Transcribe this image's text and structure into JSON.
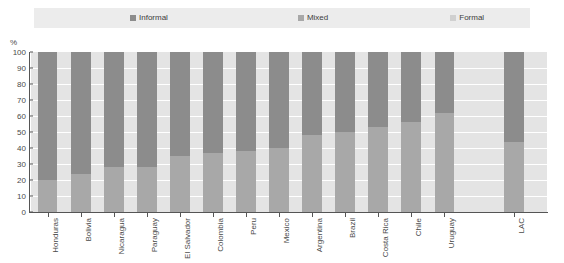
{
  "legend": {
    "items": [
      {
        "label": "Informal",
        "color": "#8c8c8c"
      },
      {
        "label": "Mixed",
        "color": "#a8a8a8"
      },
      {
        "label": "Formal",
        "color": "#d0d0d0"
      }
    ]
  },
  "axes": {
    "y_unit_label": "%",
    "y_ticks": [
      "0",
      "10",
      "20",
      "30",
      "40",
      "50",
      "60",
      "70",
      "80",
      "90",
      "100"
    ]
  },
  "chart_data": {
    "type": "bar",
    "title": "",
    "subtitle": "",
    "xlabel": "",
    "ylabel": "%",
    "ylim": [
      0,
      100
    ],
    "stacked": true,
    "normalized_percent": true,
    "grid": true,
    "legend_position": "top",
    "categories": [
      "Honduras",
      "Bolivia",
      "Nicaragua",
      "Paraguay",
      "El Salvador",
      "Colombia",
      "Peru",
      "Mexico",
      "Argentina",
      "Brazil",
      "Costa Rica",
      "Chile",
      "Uruguay",
      "LAC"
    ],
    "category_gap_before": "LAC",
    "series": [
      {
        "name": "Informal",
        "color": "#8c8c8c",
        "values": [
          80,
          76,
          72,
          72,
          65,
          63,
          62,
          60,
          52,
          50,
          47,
          44,
          38,
          56
        ]
      },
      {
        "name": "Mixed",
        "color": "#a8a8a8",
        "values": [
          20,
          24,
          28,
          28,
          35,
          37,
          38,
          40,
          48,
          50,
          53,
          56,
          62,
          44
        ]
      },
      {
        "name": "Formal",
        "color": "#d0d0d0",
        "values": [
          0,
          0,
          0,
          0,
          0,
          0,
          0,
          0,
          0,
          0,
          0,
          0,
          0,
          0
        ]
      }
    ]
  }
}
